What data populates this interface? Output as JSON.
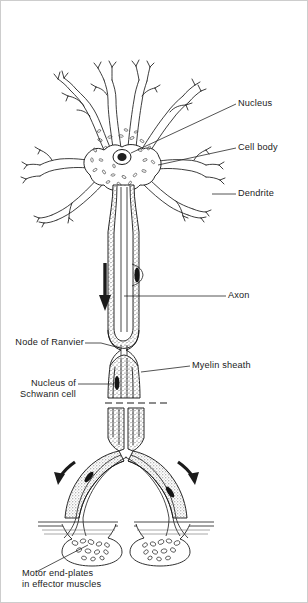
{
  "figure": {
    "kind": "labelled-biological-diagram",
    "background_color": "#ffffff",
    "ink_color": "#1b1b1b",
    "frame_color": "#cdcdcd",
    "width_px": 308,
    "height_px": 603
  },
  "labels": {
    "nucleus": "Nucleus",
    "cell_body": "Cell body",
    "dendrite": "Dendrite",
    "axon": "Axon",
    "node_of_ranvier": "Node of Ranvier",
    "myelin_sheath": "Myelin sheath",
    "nucleus_of_schwann_cell": "Nucleus of\nSchwann cell",
    "motor_end_plates": "Motor end-plates\nin effector muscles"
  },
  "structures": [
    {
      "name": "dendrite-tree",
      "description": "branching dendrites radiating from cell body"
    },
    {
      "name": "cell-body",
      "description": "soma with stippled cytoplasmic organelles"
    },
    {
      "name": "nucleus",
      "description": "dark oval nucleus inside cell body"
    },
    {
      "name": "axon",
      "description": "long central channel running downward"
    },
    {
      "name": "myelin-sheath",
      "description": "stippled sheath enclosing the axon"
    },
    {
      "name": "node-of-ranvier",
      "description": "constriction between myelin segments"
    },
    {
      "name": "schwann-cell-nucleus",
      "description": "dark elongated nucleus within sheath"
    },
    {
      "name": "axon-break",
      "description": "dashed line indicating omitted axon length"
    },
    {
      "name": "terminal-branches",
      "description": "axon divides into two diverging branches"
    },
    {
      "name": "motor-end-plate",
      "description": "synaptic swelling on muscle fibre"
    }
  ],
  "arrows": [
    {
      "name": "impulse-arrow-axon",
      "direction": "down"
    },
    {
      "name": "impulse-arrow-left-branch",
      "direction": "down-left"
    },
    {
      "name": "impulse-arrow-right-branch",
      "direction": "down-right"
    }
  ]
}
